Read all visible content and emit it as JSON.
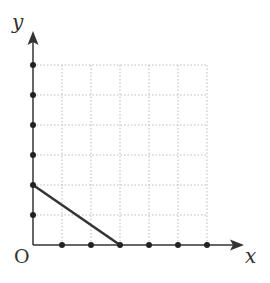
{
  "diagram": {
    "type": "coordinate-grid",
    "labels": {
      "x_axis": "x",
      "y_axis": "y",
      "origin": "O"
    },
    "grid": {
      "x_units": 6,
      "y_units": 6,
      "style": "dotted",
      "color": "#bbbbbb"
    },
    "x_axis_points": [
      1,
      2,
      3,
      4,
      5,
      6
    ],
    "y_axis_points": [
      1,
      2,
      3,
      4,
      5,
      6
    ],
    "segment": {
      "from": [
        0,
        2
      ],
      "to": [
        3,
        0
      ],
      "color": "#333333"
    },
    "colors": {
      "axis": "#333333",
      "point": "#222222"
    }
  }
}
